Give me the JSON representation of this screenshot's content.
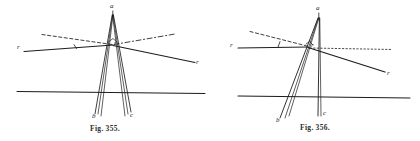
{
  "document": {
    "kind": "scanned-textbook-plate",
    "background_color": "#ffffff",
    "ink_color": "#1d1d1d"
  },
  "figures": [
    {
      "id": "fig-355",
      "caption_prefix": "Fig.",
      "caption_number": "355.",
      "labels": {
        "apex": "a",
        "base_left": "b",
        "base_right": "c",
        "crossing": "r",
        "ray_incident": "r",
        "ray_refracted": "r"
      }
    },
    {
      "id": "fig-356",
      "caption_prefix": "Fig.",
      "caption_number": "356.",
      "labels": {
        "apex": "a",
        "base_left": "b",
        "base_right": "c",
        "crossing": "r",
        "ray_incident": "r",
        "ray_refracted": "r"
      }
    }
  ]
}
